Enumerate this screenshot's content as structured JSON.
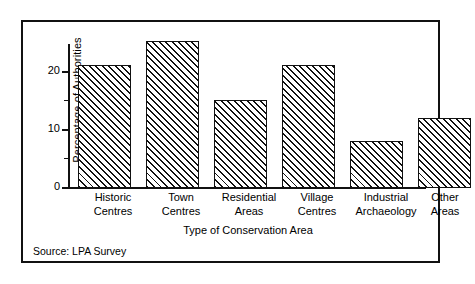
{
  "chart_data": {
    "type": "bar",
    "title": "",
    "subtitle": "",
    "xlabel": "Type of Conservation Area",
    "ylabel": "Percentage of Authorities",
    "categories": [
      "Historic Centres",
      "Town Centres",
      "Residential Areas",
      "Village Centres",
      "Industrial Archaeology",
      "Other Areas"
    ],
    "category_lines": [
      [
        "Historic",
        "Centres"
      ],
      [
        "Town",
        "Centres"
      ],
      [
        "Residential",
        "Areas"
      ],
      [
        "Village",
        "Centres"
      ],
      [
        "Industrial",
        "Archaeology"
      ],
      [
        "Other",
        "Areas"
      ]
    ],
    "values": [
      21,
      25,
      15,
      21,
      8,
      12
    ],
    "ylim": [
      0,
      24.7
    ],
    "xlim_note": "categorical",
    "yticks_major": [
      0,
      10,
      20
    ],
    "ytick_labels": [
      "0",
      "10",
      "20"
    ],
    "yticks_minor": [
      5,
      15
    ],
    "grid": false,
    "legend": null,
    "series_fill": "black diagonal hatch on white",
    "annotations": [
      "Source: LPA Survey"
    ]
  },
  "figure": {
    "source_note": "Source: LPA Survey",
    "frame_color": "#111111",
    "bar_edge_color": "#111111",
    "hatch_color": "#111111",
    "background": "#ffffff"
  }
}
